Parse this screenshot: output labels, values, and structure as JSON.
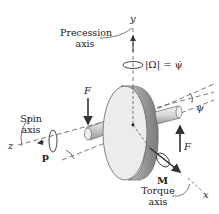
{
  "diagram": {
    "axes": {
      "y": "y",
      "z": "z",
      "x": "x"
    },
    "labels": {
      "precession_axis_line1": "Precession",
      "precession_axis_line2": "axis",
      "spin_axis_line1": "Spin",
      "spin_axis_line2": "axis",
      "torque_axis_line1": "Torque",
      "torque_axis_line2": "axis",
      "omega_eq": "|Ω| = ψ̇",
      "angle_psi": "ψ",
      "force_left": "F",
      "force_right": "F",
      "momentum": "p",
      "moment": "M"
    },
    "colors": {
      "line": "#333333",
      "dashed": "#555555",
      "disk_face": "#ececec",
      "disk_rim": "#a8a8a8",
      "shaft": "#cfcfcf"
    }
  }
}
